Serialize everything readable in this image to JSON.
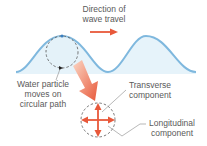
{
  "labels": {
    "direction": [
      "Direction of",
      "wave travel"
    ],
    "particle": [
      "Water particle",
      "moves on",
      "circular path"
    ],
    "transverse": [
      "Transverse",
      "component"
    ],
    "longitudinal": [
      "Longitudinal",
      "component"
    ]
  },
  "colors": {
    "wave_line": "#7fb8de",
    "wave_fill": "#e6f3fa",
    "arrow": "#e8583a",
    "dashed_circle": "#555555",
    "text": "#5a5a5a",
    "leader": "#888888"
  }
}
